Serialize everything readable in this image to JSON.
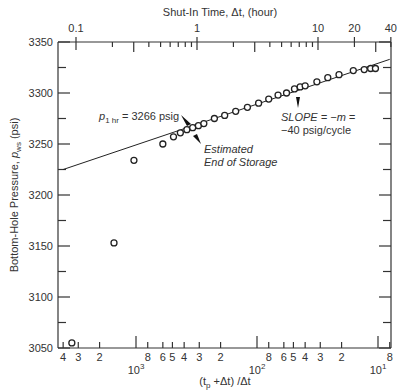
{
  "chart_data": {
    "type": "scatter",
    "title": "",
    "xlabel": "(t_p + Δt) / Δt",
    "xlabel_parts": {
      "t": "(t",
      "sub": "p",
      "rest": " +Δt) /Δt"
    },
    "x2label": "Shut-In Time, Δt, (hour)",
    "ylabel": "Bottom-Hole Pressure, p_ws (psi)",
    "ylabel_parts": {
      "pre": "Bottom-Hole Pressure, ",
      "p": "p",
      "sub": "ws",
      "post": " (psi)"
    },
    "x_scale": "log, reversed",
    "xlim": [
      4000,
      8
    ],
    "ylim": [
      3050,
      3350
    ],
    "grid": false,
    "y_ticks": [
      3050,
      3100,
      3150,
      3200,
      3250,
      3300,
      3350
    ],
    "x_bottom_tick_labels": [
      "4",
      "3",
      "2",
      "8",
      "6",
      "5",
      "4",
      "3",
      "2",
      "8",
      "6",
      "5",
      "4",
      "3",
      "2",
      "8"
    ],
    "x_bottom_decade_labels": [
      {
        "base": "10",
        "exp": "3",
        "value": 1000
      },
      {
        "base": "10",
        "exp": "2",
        "value": 100
      },
      {
        "base": "10",
        "exp": "1",
        "value": 10
      }
    ],
    "x_top_tick_labels": [
      {
        "label": "0.1",
        "value": 0.1
      },
      {
        "label": "1",
        "value": 1
      },
      {
        "label": "10",
        "value": 10
      },
      {
        "label": "20",
        "value": 20
      },
      {
        "label": "40",
        "value": 40
      }
    ],
    "series": [
      {
        "name": "Measured shut-in pressure",
        "marker": "open-circle",
        "points": [
          {
            "ratio": 3390,
            "p": 3055
          },
          {
            "ratio": 1520,
            "p": 3153
          },
          {
            "ratio": 1040,
            "p": 3234
          },
          {
            "ratio": 600,
            "p": 3250
          },
          {
            "ratio": 490,
            "p": 3257
          },
          {
            "ratio": 430,
            "p": 3261
          },
          {
            "ratio": 380,
            "p": 3264
          },
          {
            "ratio": 340,
            "p": 3266
          },
          {
            "ratio": 305,
            "p": 3268
          },
          {
            "ratio": 275,
            "p": 3270
          },
          {
            "ratio": 225,
            "p": 3275
          },
          {
            "ratio": 185,
            "p": 3278
          },
          {
            "ratio": 150,
            "p": 3282
          },
          {
            "ratio": 120,
            "p": 3286
          },
          {
            "ratio": 97,
            "p": 3290
          },
          {
            "ratio": 80,
            "p": 3294
          },
          {
            "ratio": 67,
            "p": 3298
          },
          {
            "ratio": 57,
            "p": 3300
          },
          {
            "ratio": 49,
            "p": 3304
          },
          {
            "ratio": 44,
            "p": 3306
          },
          {
            "ratio": 40,
            "p": 3307
          },
          {
            "ratio": 32,
            "p": 3311
          },
          {
            "ratio": 26,
            "p": 3315
          },
          {
            "ratio": 21,
            "p": 3318
          },
          {
            "ratio": 16,
            "p": 3322
          },
          {
            "ratio": 13,
            "p": 3323
          },
          {
            "ratio": 11.5,
            "p": 3324
          },
          {
            "ratio": 10.5,
            "p": 3324
          }
        ]
      },
      {
        "name": "Semilog straight line",
        "type": "line",
        "points": [
          {
            "ratio": 4000,
            "p": 3225
          },
          {
            "ratio": 8,
            "p": 3333
          }
        ]
      }
    ],
    "annotations": [
      {
        "id": "p1hr",
        "text_p": "p",
        "text_sub": "1 hr",
        "text_rest": " = 3266 psig"
      },
      {
        "id": "storage",
        "lines": [
          "Estimated",
          "End of Storage"
        ]
      },
      {
        "id": "slope",
        "lines": [
          "SLOPE = −m =",
          "−40 psig/cycle"
        ]
      }
    ]
  }
}
